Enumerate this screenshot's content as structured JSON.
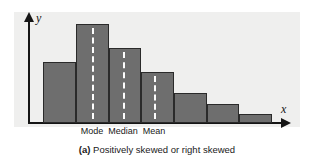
{
  "figure": {
    "caption_tag": "(a)",
    "caption_text": "Positively skewed or right skewed",
    "panel_color": "#efefee",
    "bar_color": "#6e6e6e",
    "bar_edge_color": "#2a2a2a",
    "marker_color": "#fdfdfd",
    "axis_color": "#151515"
  },
  "axes": {
    "y_label": "y",
    "x_label": "x"
  },
  "markers": [
    {
      "name": "mode",
      "label": "Mode",
      "x": 92
    },
    {
      "name": "median",
      "label": "Median",
      "x": 123
    },
    {
      "name": "mean",
      "label": "Mean",
      "x": 154
    }
  ],
  "chart_data": {
    "type": "bar",
    "title": "(a) Positively skewed or right skewed",
    "xlabel": "x",
    "ylabel": "y",
    "grid": false,
    "legend": "none",
    "categories": [
      "1",
      "2",
      "3",
      "4",
      "5",
      "6",
      "7"
    ],
    "values": [
      61,
      99,
      75,
      51,
      30,
      19,
      9
    ],
    "ylim": [
      0,
      111
    ],
    "bar_left_px": [
      43,
      76,
      109,
      141,
      174,
      207,
      239
    ],
    "bar_width_px": [
      33,
      33,
      32,
      33,
      33,
      32,
      33
    ],
    "baseline_px": 123,
    "annotations": [
      {
        "label": "Mode",
        "x_px": 92,
        "style": "white-dashed-vertical-line"
      },
      {
        "label": "Median",
        "x_px": 123,
        "style": "white-dashed-vertical-line"
      },
      {
        "label": "Mean",
        "x_px": 154,
        "style": "white-dashed-vertical-line"
      }
    ]
  }
}
